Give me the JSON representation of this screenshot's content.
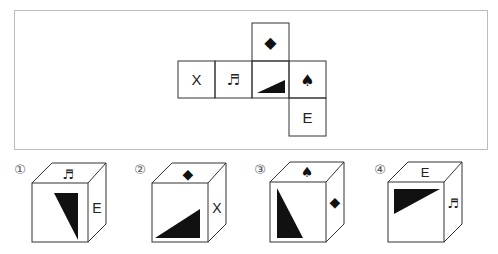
{
  "figure": {
    "type": "cube-net-puzzle",
    "net": {
      "cells": [
        {
          "id": "x",
          "row": 1,
          "col": 0,
          "symbol": "X"
        },
        {
          "id": "note",
          "row": 1,
          "col": 1,
          "symbol": "♬"
        },
        {
          "id": "triangle",
          "row": 1,
          "col": 2,
          "symbol": "black-triangle"
        },
        {
          "id": "spade",
          "row": 1,
          "col": 3,
          "symbol": "♠"
        },
        {
          "id": "diamond",
          "row": 0,
          "col": 2,
          "symbol": "◆"
        },
        {
          "id": "e",
          "row": 2,
          "col": 3,
          "symbol": "E"
        }
      ]
    },
    "options": [
      {
        "label": "①",
        "top": "♬",
        "front": "black-triangle",
        "side": "E"
      },
      {
        "label": "②",
        "top": "◆",
        "front": "black-triangle",
        "side": "X"
      },
      {
        "label": "③",
        "top": "♠",
        "front": "black-triangle",
        "side": "◆"
      },
      {
        "label": "④",
        "top": "E",
        "front": "black-triangle",
        "side": "♬"
      }
    ]
  },
  "net_text": {
    "x": "X",
    "note": "♬",
    "spade": "♠",
    "diamond": "◆",
    "e": "E"
  },
  "option_labels": [
    "①",
    "②",
    "③",
    "④"
  ],
  "option_text": {
    "o1_top": "♬",
    "o1_side": "E",
    "o2_top": "◆",
    "o2_side": "X",
    "o3_top": "♠",
    "o3_side": "◆",
    "o4_top": "E",
    "o4_side": "♬"
  }
}
